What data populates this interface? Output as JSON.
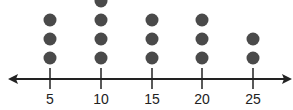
{
  "chart_data": {
    "type": "dot_plot",
    "title": "",
    "xlabel": "",
    "ylabel": "",
    "categories": [
      "5",
      "10",
      "15",
      "20",
      "25"
    ],
    "x": [
      5,
      10,
      15,
      20,
      25
    ],
    "values": [
      3,
      4,
      3,
      3,
      2
    ],
    "axis": {
      "arrows_both_ends": true,
      "grid": false
    },
    "colors": {
      "dot": "#4a4a4a",
      "axis": "#222222"
    }
  },
  "labels": {
    "t0": "5",
    "t1": "10",
    "t2": "15",
    "t3": "20",
    "t4": "25"
  }
}
